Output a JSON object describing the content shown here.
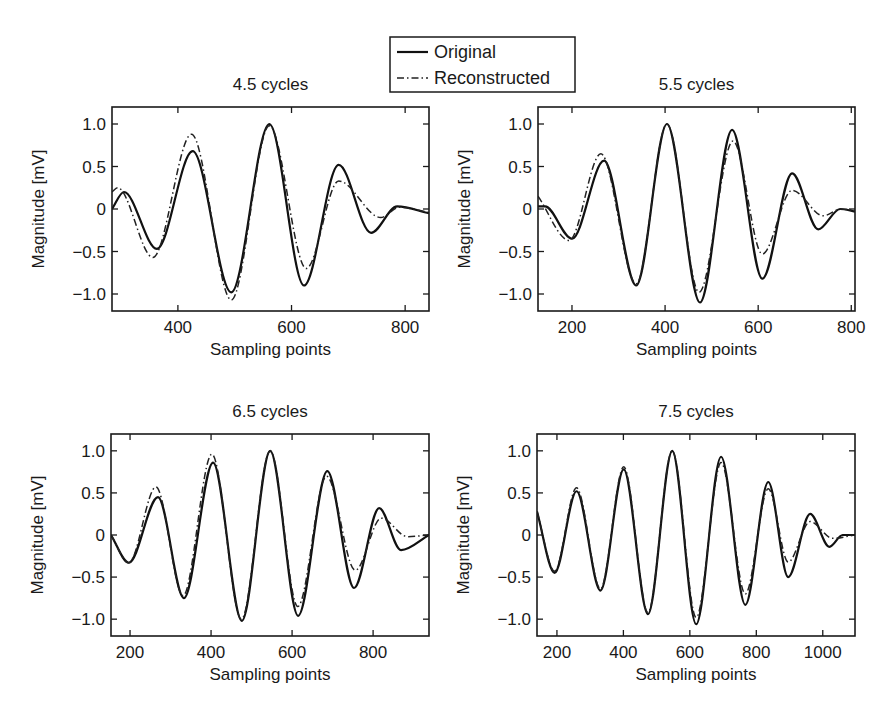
{
  "chart_data": [
    {
      "type": "line",
      "title": "4.5 cycles",
      "xlabel": "Sampling points",
      "ylabel": "Magnitude [mV]",
      "xlim": [
        284,
        842
      ],
      "ylim": [
        -1.2,
        1.2
      ],
      "xticks": [
        400,
        600,
        800
      ],
      "xtick_labels": [
        "400",
        "600",
        "800"
      ],
      "yticks": [
        1.0,
        0.5,
        0,
        -0.5,
        -1.0
      ],
      "ytick_labels": [
        "1.0",
        "0.5",
        "0",
        "−0.5",
        "−1.0"
      ],
      "grid": false,
      "series": [
        {
          "name": "Original",
          "style": "solid",
          "x": [
            284,
            305,
            363,
            426,
            494,
            561,
            622,
            683,
            740,
            786,
            842
          ],
          "y": [
            0.0,
            0.2,
            -0.47,
            0.68,
            -0.98,
            1.0,
            -0.9,
            0.52,
            -0.28,
            0.03,
            -0.05
          ]
        },
        {
          "name": "Reconstructed",
          "style": "dash-dot",
          "x": [
            284,
            294,
            356,
            424,
            494,
            561,
            626,
            683,
            757,
            790,
            842
          ],
          "y": [
            0.2,
            0.25,
            -0.57,
            0.88,
            -1.07,
            0.98,
            -0.7,
            0.33,
            -0.1,
            0.02,
            -0.04
          ]
        }
      ]
    },
    {
      "type": "line",
      "title": "5.5 cycles",
      "xlabel": "Sampling points",
      "ylabel": "Magnitude [mV]",
      "xlim": [
        127,
        808
      ],
      "ylim": [
        -1.2,
        1.2
      ],
      "xticks": [
        200,
        400,
        600,
        800
      ],
      "xtick_labels": [
        "200",
        "400",
        "600",
        "800"
      ],
      "yticks": [
        1.0,
        0.5,
        0,
        -0.5,
        -1.0
      ],
      "ytick_labels": [
        "1.0",
        "0.5",
        "0",
        "−0.5",
        "−1.0"
      ],
      "grid": false,
      "series": [
        {
          "name": "Original",
          "style": "solid",
          "x": [
            127,
            142,
            200,
            269,
            338,
            404,
            475,
            544,
            609,
            673,
            729,
            776,
            808
          ],
          "y": [
            0.03,
            0.03,
            -0.35,
            0.57,
            -0.9,
            1.0,
            -1.1,
            0.93,
            -0.82,
            0.42,
            -0.24,
            0.0,
            -0.03
          ]
        },
        {
          "name": "Reconstructed",
          "style": "dash-dot",
          "x": [
            127,
            194,
            262,
            338,
            404,
            473,
            546,
            609,
            673,
            740,
            778,
            808
          ],
          "y": [
            0.15,
            -0.37,
            0.65,
            -0.88,
            1.0,
            -0.98,
            0.8,
            -0.53,
            0.22,
            -0.08,
            0.0,
            -0.02
          ]
        }
      ]
    },
    {
      "type": "line",
      "title": "6.5 cycles",
      "xlabel": "Sampling points",
      "ylabel": "Magnitude [mV]",
      "xlim": [
        153,
        938
      ],
      "ylim": [
        -1.2,
        1.2
      ],
      "xticks": [
        200,
        400,
        600,
        800
      ],
      "xtick_labels": [
        "200",
        "400",
        "600",
        "800"
      ],
      "yticks": [
        1.0,
        0.5,
        0,
        -0.5,
        -1.0
      ],
      "ytick_labels": [
        "1.0",
        "0.5",
        "0",
        "−0.5",
        "−1.0"
      ],
      "grid": false,
      "series": [
        {
          "name": "Original",
          "style": "solid",
          "x": [
            153,
            197,
            269,
            333,
            405,
            476,
            546,
            615,
            687,
            753,
            815,
            869,
            938
          ],
          "y": [
            0.0,
            -0.33,
            0.45,
            -0.75,
            0.86,
            -1.02,
            1.0,
            -0.96,
            0.76,
            -0.63,
            0.32,
            -0.18,
            0.0
          ]
        },
        {
          "name": "Reconstructed",
          "style": "dash-dot",
          "x": [
            153,
            197,
            264,
            331,
            402,
            475,
            546,
            614,
            685,
            756,
            820,
            885,
            938
          ],
          "y": [
            0.0,
            -0.33,
            0.57,
            -0.72,
            0.96,
            -1.0,
            1.0,
            -0.85,
            0.7,
            -0.42,
            0.2,
            -0.02,
            0.0
          ]
        }
      ]
    },
    {
      "type": "line",
      "title": "7.5 cycles",
      "xlabel": "Sampling points",
      "ylabel": "Magnitude [mV]",
      "xlim": [
        140,
        1097
      ],
      "ylim": [
        -1.2,
        1.2
      ],
      "xticks": [
        200,
        400,
        600,
        800,
        1000
      ],
      "xtick_labels": [
        "200",
        "400",
        "600",
        "800",
        "1000"
      ],
      "yticks": [
        1.0,
        0.5,
        0,
        -0.5,
        -1.0
      ],
      "ytick_labels": [
        "1.0",
        "0.5",
        "0",
        "−0.5",
        "−1.0"
      ],
      "grid": false,
      "series": [
        {
          "name": "Original",
          "style": "solid",
          "x": [
            140,
            193,
            259,
            331,
            401,
            474,
            547,
            619,
            694,
            767,
            836,
            896,
            962,
            1020,
            1060,
            1097
          ],
          "y": [
            0.28,
            -0.45,
            0.52,
            -0.66,
            0.78,
            -0.94,
            1.0,
            -1.06,
            0.93,
            -0.83,
            0.63,
            -0.5,
            0.25,
            -0.14,
            0.0,
            0.0
          ]
        },
        {
          "name": "Reconstructed",
          "style": "dash-dot",
          "x": [
            140,
            193,
            259,
            331,
            401,
            474,
            547,
            619,
            694,
            767,
            836,
            896,
            962,
            1030,
            1097
          ],
          "y": [
            0.28,
            -0.43,
            0.56,
            -0.64,
            0.81,
            -0.92,
            1.0,
            -0.98,
            0.86,
            -0.7,
            0.55,
            -0.32,
            0.16,
            -0.04,
            0.0
          ]
        }
      ]
    }
  ],
  "legend": {
    "position": "top-center",
    "entries": [
      {
        "label": "Original",
        "style": "solid"
      },
      {
        "label": "Reconstructed",
        "style": "dash-dot"
      }
    ]
  }
}
